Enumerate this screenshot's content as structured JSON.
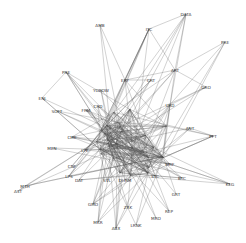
{
  "graph": {
    "type": "network",
    "background": "#ffffff",
    "edge_color": "#555555",
    "label_color": "#333333",
    "nodes": [
      {
        "id": "AMB",
        "x": 100,
        "y": 25
      },
      {
        "id": "DATA",
        "x": 186,
        "y": 14
      },
      {
        "id": "ITC",
        "x": 149,
        "y": 29
      },
      {
        "id": "PRE",
        "x": 225,
        "y": 42
      },
      {
        "id": "PRE2",
        "label": "PRE",
        "x": 66,
        "y": 72
      },
      {
        "id": "ART",
        "x": 175,
        "y": 70
      },
      {
        "id": "ERY",
        "x": 125,
        "y": 80
      },
      {
        "id": "CRT",
        "x": 151,
        "y": 80
      },
      {
        "id": "GRO",
        "x": 206,
        "y": 87
      },
      {
        "id": "YOBOW",
        "x": 101,
        "y": 90
      },
      {
        "id": "ENJ",
        "x": 42,
        "y": 98
      },
      {
        "id": "SOFT",
        "x": 57,
        "y": 111
      },
      {
        "id": "FRM",
        "x": 86,
        "y": 110
      },
      {
        "id": "CRD",
        "x": 98,
        "y": 106
      },
      {
        "id": "URD",
        "x": 170,
        "y": 105
      },
      {
        "id": "ANT",
        "x": 190,
        "y": 128
      },
      {
        "id": "PPT",
        "x": 213,
        "y": 136
      },
      {
        "id": "MEN",
        "x": 52,
        "y": 148
      },
      {
        "id": "CME",
        "x": 72,
        "y": 137
      },
      {
        "id": "LPE",
        "x": 85,
        "y": 150
      },
      {
        "id": "MRF",
        "x": 170,
        "y": 164
      },
      {
        "id": "CNF",
        "x": 72,
        "y": 166
      },
      {
        "id": "LPS",
        "x": 69,
        "y": 176
      },
      {
        "id": "DAT",
        "x": 79,
        "y": 180
      },
      {
        "id": "MTH",
        "x": 25,
        "y": 186
      },
      {
        "id": "AST",
        "x": 18,
        "y": 191
      },
      {
        "id": "SVL",
        "x": 107,
        "y": 180
      },
      {
        "id": "DHRM",
        "x": 125,
        "y": 180
      },
      {
        "id": "STC",
        "x": 155,
        "y": 176
      },
      {
        "id": "BTC",
        "x": 182,
        "y": 178
      },
      {
        "id": "KEG",
        "x": 230,
        "y": 184
      },
      {
        "id": "GRT",
        "x": 176,
        "y": 194
      },
      {
        "id": "GMO",
        "x": 93,
        "y": 204
      },
      {
        "id": "ZRK",
        "x": 128,
        "y": 207
      },
      {
        "id": "REP",
        "x": 169,
        "y": 211
      },
      {
        "id": "MRO",
        "x": 156,
        "y": 218
      },
      {
        "id": "MKR",
        "x": 98,
        "y": 222
      },
      {
        "id": "ABX",
        "x": 116,
        "y": 228
      },
      {
        "id": "LRNK",
        "x": 136,
        "y": 225
      }
    ],
    "core_cluster": {
      "cx": 128,
      "cy": 140,
      "rx": 42,
      "ry": 38,
      "node_count": 30
    }
  }
}
